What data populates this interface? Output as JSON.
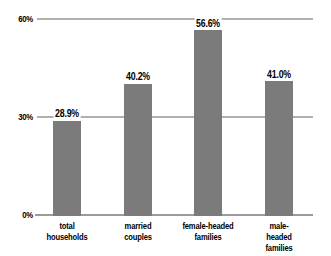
{
  "chart_data": {
    "type": "bar",
    "title": "",
    "xlabel": "",
    "ylabel": "",
    "categories": [
      "total\nhouseholds",
      "married\ncouples",
      "female-headed\nfamilies",
      "male-headed\nfamilies"
    ],
    "category_slugs": [
      "total-households",
      "married-couples",
      "female-headed-families",
      "male-headed-families"
    ],
    "values": [
      28.9,
      40.2,
      56.6,
      41.0
    ],
    "value_labels": [
      "28.9%",
      "40.2%",
      "56.6%",
      "41.0%"
    ],
    "yticks": [
      {
        "label": "0%",
        "value": 0
      },
      {
        "label": "30%",
        "value": 30
      },
      {
        "label": "60%",
        "value": 60
      }
    ],
    "ylim": [
      0,
      60
    ],
    "grid": true,
    "legend": "none",
    "colors": {
      "bar": "#7b7b7b",
      "gridline": "#b0b0b0",
      "axis": "#9b9b9b",
      "text": "#000000",
      "background": "#ffffff"
    }
  }
}
